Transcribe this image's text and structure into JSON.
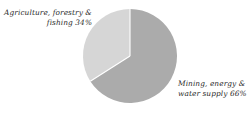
{
  "chart_data": {
    "type": "pie",
    "title": "",
    "subtitle": "",
    "xlabel": "",
    "ylabel": "",
    "grid": false,
    "legend_position": "none",
    "label_style": "callout-text-outside",
    "start_angle_deg": 0,
    "direction": "clockwise",
    "categories": [
      "Mining, energy & water supply",
      "Agriculture, forestry & fishing"
    ],
    "values": [
      66,
      34
    ],
    "unit": "%",
    "slices": [
      {
        "name": "Mining, energy & water supply",
        "value": 66,
        "percent_text": "66%",
        "color": "#ababab",
        "label_lines": [
          "Mining, energy &",
          "water supply 66%"
        ],
        "label_align": "left"
      },
      {
        "name": "Agriculture, forestry & fishing",
        "value": 34,
        "percent_text": "34%",
        "color": "#d6d6d6",
        "label_lines": [
          "Agriculture, forestry &",
          "fishing 34%"
        ],
        "label_align": "right"
      }
    ]
  },
  "colors": {
    "background": "#ffffff",
    "slice_dark": "#ababab",
    "slice_light": "#d6d6d6",
    "separator": "#ffffff",
    "text": "#2b2b2b"
  },
  "labels": {
    "agriculture": {
      "line1": "Agriculture, forestry &",
      "line2": "fishing 34%"
    },
    "mining": {
      "line1": "Mining, energy &",
      "line2": "water supply 66%"
    }
  }
}
